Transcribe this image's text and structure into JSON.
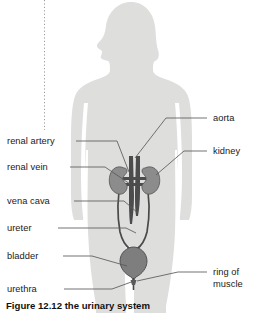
{
  "figure": {
    "caption": "Figure 12.12 the urinary system",
    "alt_title": "the urinary system"
  },
  "colors": {
    "body_silhouette": "#dededd",
    "organ_fill": "#8c8c8c",
    "organ_stroke": "#4a4a4a",
    "vessel_dark": "#4c4c4c",
    "leader_line": "#5a5a5a",
    "label_text": "#1a1a1a",
    "background": "#ffffff",
    "dotted_rule": "#9a9a9a"
  },
  "labels_left": [
    {
      "id": "renal-artery",
      "text": "renal artery"
    },
    {
      "id": "renal-vein",
      "text": "renal vein"
    },
    {
      "id": "vena-cava",
      "text": "vena cava"
    },
    {
      "id": "ureter",
      "text": "ureter"
    },
    {
      "id": "bladder",
      "text": "bladder"
    },
    {
      "id": "urethra",
      "text": "urethra"
    }
  ],
  "labels_right": [
    {
      "id": "aorta",
      "text": "aorta"
    },
    {
      "id": "kidney",
      "text": "kidney"
    },
    {
      "id": "ring-of-muscle-line1",
      "text": "ring of"
    },
    {
      "id": "ring-of-muscle-line2",
      "text": "muscle"
    }
  ],
  "organs": [
    {
      "id": "kidney-left",
      "name": "kidney"
    },
    {
      "id": "kidney-right",
      "name": "kidney"
    },
    {
      "id": "aorta-vessel",
      "name": "aorta"
    },
    {
      "id": "vena-cava-vessel",
      "name": "vena cava"
    },
    {
      "id": "renal-artery-vessel",
      "name": "renal artery"
    },
    {
      "id": "renal-vein-vessel",
      "name": "renal vein"
    },
    {
      "id": "ureter-left",
      "name": "ureter"
    },
    {
      "id": "ureter-right",
      "name": "ureter"
    },
    {
      "id": "bladder-organ",
      "name": "bladder"
    },
    {
      "id": "urethra-tube",
      "name": "urethra"
    },
    {
      "id": "sphincter-ring",
      "name": "ring of muscle"
    }
  ]
}
